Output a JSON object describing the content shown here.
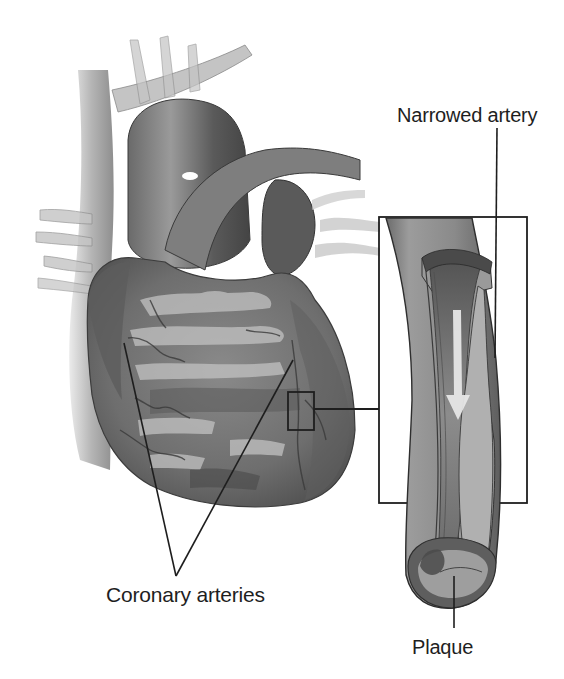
{
  "figure": {
    "labels": {
      "narrowed_artery": "Narrowed artery",
      "coronary_arteries": "Coronary arteries",
      "plaque": "Plaque"
    },
    "icons": {
      "blood_flow": "down-arrow-icon"
    },
    "colors": {
      "background": "#ffffff",
      "line": "#1e1e1e",
      "tissue_dark": "#4a4a4a",
      "tissue_mid": "#7a7a7a",
      "tissue_light": "#b8b8b8",
      "plaque": "#9a9a9a"
    }
  }
}
